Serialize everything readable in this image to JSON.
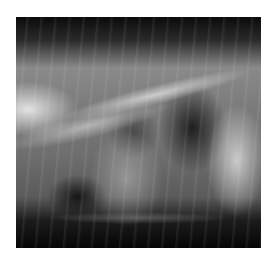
{
  "image": {
    "description": "Lateral thoracic radiograph (X-ray) of an animal showing spine, ribs, heart and lungs",
    "colors": {
      "background": "#ffffff",
      "dark": "#0a0a0a",
      "bone": "#e6e6e6"
    }
  }
}
